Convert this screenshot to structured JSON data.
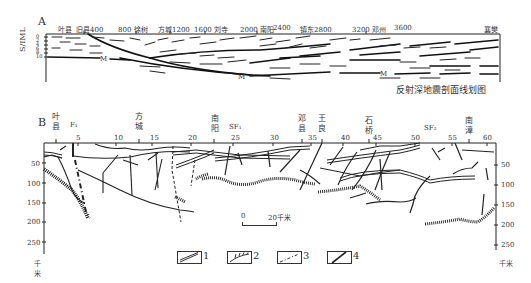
{
  "panel_a": {
    "letter": "A",
    "y_axis_label": "S/IML",
    "y_ticks": [
      "0",
      "2",
      "4",
      "6",
      "8",
      "10"
    ],
    "top_labels": [
      {
        "text": "叶县",
        "x": 42
      },
      {
        "text": "旧县400",
        "x": 68
      },
      {
        "text": "800 徐树",
        "x": 120
      },
      {
        "text": "方城1200",
        "x": 160
      },
      {
        "text": "1600 刘寺",
        "x": 196
      },
      {
        "text": "2000 南阳",
        "x": 242
      },
      {
        "text": "2400",
        "x": 277
      },
      {
        "text": "镇东2800",
        "x": 300
      },
      {
        "text": "3200 邓州",
        "x": 352
      },
      {
        "text": "3600",
        "x": 394
      },
      {
        "text": "襄樊",
        "x": 484
      }
    ],
    "moho_label": "M",
    "caption": "反射深地震剖面线划图"
  },
  "panel_b": {
    "letter": "B",
    "top_ticks": [
      "5",
      "10",
      "15",
      "20",
      "25",
      "30",
      "35",
      "40",
      "45",
      "50",
      "55",
      "60"
    ],
    "place_labels": [
      {
        "chars": [
          "叶",
          "县"
        ],
        "x": 54
      },
      {
        "chars": [
          "方",
          "城"
        ],
        "x": 137
      },
      {
        "chars": [
          "南",
          "阳"
        ],
        "x": 213
      },
      {
        "chars": [
          "邓",
          "县"
        ],
        "x": 300
      },
      {
        "chars": [
          "王",
          "良"
        ],
        "x": 320
      },
      {
        "chars": [
          "石",
          "桥"
        ],
        "x": 367
      },
      {
        "chars": [
          "南",
          "漳"
        ],
        "x": 467
      }
    ],
    "fault_labels": [
      {
        "text": "F₁",
        "x": 72
      },
      {
        "text": "SF₁",
        "x": 232
      },
      {
        "text": "SF₂",
        "x": 424
      }
    ],
    "depth_ticks": [
      "50",
      "100",
      "150",
      "200",
      "250"
    ],
    "depth_unit": "千米",
    "scale_bar": {
      "start": "0",
      "end": "20千米"
    }
  },
  "legend": {
    "items": [
      {
        "num": "1",
        "icon": "double-line-reflector-icon"
      },
      {
        "num": "2",
        "icon": "hatched-boundary-icon"
      },
      {
        "num": "3",
        "icon": "dash-dot-fault-icon"
      },
      {
        "num": "4",
        "icon": "solid-fault-icon"
      }
    ]
  }
}
